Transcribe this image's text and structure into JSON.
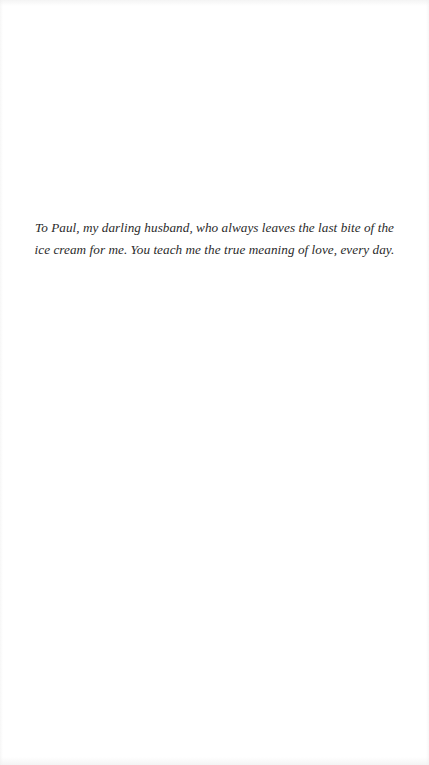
{
  "page": {
    "type": "dedication",
    "background_color": "#ffffff",
    "text_color": "#2b2b2b"
  },
  "dedication": {
    "lines": [
      "To Paul, my darling husband, who always leaves the last bite of the",
      "ice cream for me. You teach me the true meaning of love, every day."
    ]
  }
}
